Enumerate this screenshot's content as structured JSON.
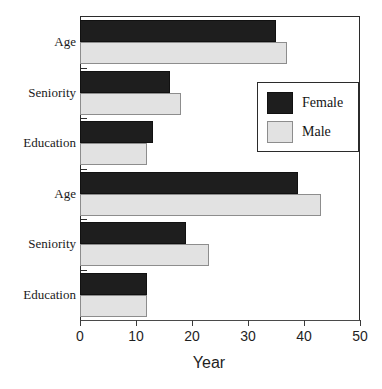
{
  "chart_data": {
    "type": "bar",
    "orientation": "horizontal",
    "title": "",
    "xlabel": "Year",
    "ylabel": "",
    "xlim": [
      0,
      50
    ],
    "xticks": [
      0,
      10,
      20,
      30,
      40,
      50
    ],
    "grid": false,
    "legend_position": "upper right",
    "categories": [
      "Age",
      "Seniority",
      "Education",
      "Age",
      "Seniority",
      "Education"
    ],
    "series": [
      {
        "name": "Female",
        "color": "#1e1e1e",
        "values": [
          35,
          16,
          13,
          39,
          19,
          12
        ]
      },
      {
        "name": "Male",
        "color": "#e2e2e2",
        "values": [
          37,
          18,
          12,
          43,
          23,
          12
        ]
      }
    ]
  },
  "axis": {
    "x_title": "Year",
    "x_tick_labels": [
      "0",
      "10",
      "20",
      "30",
      "40",
      "50"
    ],
    "y_tick_labels": [
      "Age",
      "Seniority",
      "Education",
      "Age",
      "Seniority",
      "Education"
    ]
  },
  "legend": {
    "entries": [
      {
        "label": "Female",
        "swatch": "dark-swatch"
      },
      {
        "label": "Male",
        "swatch": "light-swatch"
      }
    ]
  },
  "colors": {
    "female": "#1e1e1e",
    "male": "#e2e2e2",
    "axis": "#2b2b2b",
    "background": "#ffffff"
  }
}
